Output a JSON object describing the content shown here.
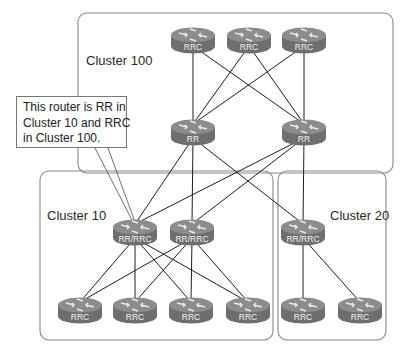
{
  "clusters": [
    {
      "id": "cluster-100",
      "label": "Cluster 100",
      "box": {
        "x": 78,
        "y": 13,
        "w": 315,
        "h": 160
      }
    },
    {
      "id": "cluster-10",
      "label": "Cluster 10",
      "box": {
        "x": 40,
        "y": 171,
        "w": 233,
        "h": 169
      }
    },
    {
      "id": "cluster-20",
      "label": "Cluster 20",
      "box": {
        "x": 278,
        "y": 171,
        "w": 108,
        "h": 169
      }
    }
  ],
  "callout": {
    "lines": [
      "This router is RR in",
      "Cluster 10 and RRC",
      "in Cluster 100."
    ],
    "points_to": "cluster10-rr-rrc-1"
  },
  "routers": [
    {
      "id": "c100-rrc-1",
      "label": "RRC",
      "x": 193,
      "y": 40
    },
    {
      "id": "c100-rrc-2",
      "label": "RRC",
      "x": 249,
      "y": 40
    },
    {
      "id": "c100-rrc-3",
      "label": "RRC",
      "x": 304,
      "y": 40
    },
    {
      "id": "c100-rr-1",
      "label": "RR",
      "x": 193,
      "y": 132
    },
    {
      "id": "c100-rr-2",
      "label": "RR",
      "x": 304,
      "y": 132
    },
    {
      "id": "cluster10-rr-rrc-1",
      "label": "RR/RRC",
      "x": 135,
      "y": 232
    },
    {
      "id": "cluster10-rr-rrc-2",
      "label": "RR/RRC",
      "x": 192,
      "y": 232
    },
    {
      "id": "cluster20-rr-rrc",
      "label": "RR/RRC",
      "x": 303,
      "y": 232
    },
    {
      "id": "c10-rrc-1",
      "label": "RRC",
      "x": 80,
      "y": 310
    },
    {
      "id": "c10-rrc-2",
      "label": "RRC",
      "x": 135,
      "y": 310
    },
    {
      "id": "c10-rrc-3",
      "label": "RRC",
      "x": 191,
      "y": 310
    },
    {
      "id": "c10-rrc-4",
      "label": "RRC",
      "x": 248,
      "y": 310
    },
    {
      "id": "c20-rrc-1",
      "label": "RRC",
      "x": 303,
      "y": 310
    },
    {
      "id": "c20-rrc-2",
      "label": "RRC",
      "x": 360,
      "y": 310
    }
  ],
  "links": [
    [
      "c100-rrc-1",
      "c100-rr-1"
    ],
    [
      "c100-rrc-1",
      "c100-rr-2"
    ],
    [
      "c100-rrc-2",
      "c100-rr-1"
    ],
    [
      "c100-rrc-2",
      "c100-rr-2"
    ],
    [
      "c100-rrc-3",
      "c100-rr-1"
    ],
    [
      "c100-rrc-3",
      "c100-rr-2"
    ],
    [
      "c100-rr-1",
      "cluster10-rr-rrc-1"
    ],
    [
      "c100-rr-1",
      "cluster10-rr-rrc-2"
    ],
    [
      "c100-rr-1",
      "cluster20-rr-rrc"
    ],
    [
      "c100-rr-2",
      "cluster10-rr-rrc-1"
    ],
    [
      "c100-rr-2",
      "cluster10-rr-rrc-2"
    ],
    [
      "c100-rr-2",
      "cluster20-rr-rrc"
    ],
    [
      "cluster10-rr-rrc-1",
      "c10-rrc-1"
    ],
    [
      "cluster10-rr-rrc-1",
      "c10-rrc-2"
    ],
    [
      "cluster10-rr-rrc-1",
      "c10-rrc-3"
    ],
    [
      "cluster10-rr-rrc-1",
      "c10-rrc-4"
    ],
    [
      "cluster10-rr-rrc-2",
      "c10-rrc-1"
    ],
    [
      "cluster10-rr-rrc-2",
      "c10-rrc-2"
    ],
    [
      "cluster10-rr-rrc-2",
      "c10-rrc-3"
    ],
    [
      "cluster10-rr-rrc-2",
      "c10-rrc-4"
    ],
    [
      "cluster20-rr-rrc",
      "c20-rrc-1"
    ],
    [
      "cluster20-rr-rrc",
      "c20-rrc-2"
    ]
  ],
  "colors": {
    "router_body": "#6e6e6e",
    "router_top": "#8c8c8c",
    "box_border": "#8a8a8a",
    "link": "#1e1e1e"
  }
}
